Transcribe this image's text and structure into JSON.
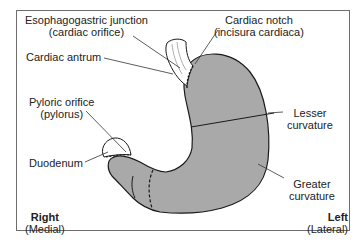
{
  "diagram": {
    "colors": {
      "fill": "#a9a9a9",
      "outline": "#1a1a1a",
      "leader": "#333333",
      "frame": "#6e6e6e"
    },
    "labels": {
      "esophagogastric_junction": {
        "line1": "Esophagogastric junction",
        "line2": "(cardiac orifice)"
      },
      "cardiac_notch": {
        "line1": "Cardiac notch",
        "line2": "(incisura cardiaca)"
      },
      "cardiac_antrum": {
        "line1": "Cardiac antrum"
      },
      "pyloric_orifice": {
        "line1": "Pyloric orifice",
        "line2": "(pylorus)"
      },
      "duodenum": {
        "line1": "Duodenum"
      },
      "lesser_curvature": {
        "line1": "Lesser",
        "line2": "curvature"
      },
      "greater_curvature": {
        "line1": "Greater",
        "line2": "curvature"
      },
      "right": {
        "line1": "Right",
        "line2": "(Medial)"
      },
      "left": {
        "line1": "Left",
        "line2": "(Lateral)"
      }
    }
  }
}
